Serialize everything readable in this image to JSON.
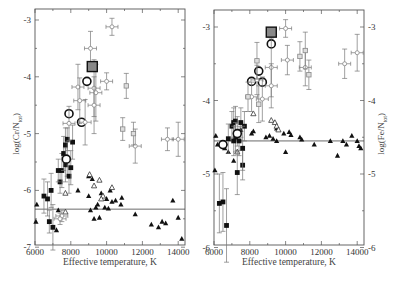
{
  "chart_data": [
    {
      "type": "scatter",
      "title": "",
      "xlabel": "Effective temperature, K",
      "ylabel": "log(Cr/N_tot)",
      "ylabel_main": "log(Cr/N",
      "ylabel_sub": "tot",
      "ylabel_close": ")",
      "xlim": [
        6000,
        14500
      ],
      "ylim": [
        -7,
        -2.8
      ],
      "xticks": [
        6000,
        8000,
        10000,
        12000,
        14000
      ],
      "xtick_labels": [
        "6000",
        "8000",
        "10000",
        "12000",
        "14000"
      ],
      "yticks": [
        -3,
        -4,
        -5,
        -6,
        -7
      ],
      "ytick_labels": [
        "-3",
        "-4",
        "-5",
        "-6",
        "-7"
      ],
      "ytick_side": "left",
      "grid": false,
      "reference_line": -6.33,
      "frame": {
        "x0": 35,
        "x1": 185,
        "y0": 9,
        "y1": 245
      },
      "map": {
        "x_at_6000": 35,
        "px_per_1000K": 17.9,
        "y_at_minus3": 20,
        "px_per_dex": 56.8
      },
      "series": [
        {
          "name": "Normal A stars (filled triangles)",
          "marker": "triangle-filled",
          "points": [
            [
              6100,
              -6.25
            ],
            [
              6050,
              -6.55
            ],
            [
              7200,
              -6.7
            ],
            [
              7300,
              -6.35
            ],
            [
              8400,
              -6.0
            ],
            [
              9000,
              -5.75
            ],
            [
              9000,
              -6.1
            ],
            [
              9200,
              -5.8
            ],
            [
              9100,
              -6.35
            ],
            [
              9300,
              -6.5
            ],
            [
              9400,
              -6.3
            ],
            [
              9500,
              -6.25
            ],
            [
              9600,
              -6.48
            ],
            [
              9700,
              -6.05
            ],
            [
              9800,
              -6.1
            ],
            [
              9900,
              -6.3
            ],
            [
              10000,
              -6.15
            ],
            [
              10100,
              -6.32
            ],
            [
              10200,
              -6.0
            ],
            [
              10300,
              -6.2
            ],
            [
              10500,
              -6.18
            ],
            [
              10800,
              -6.25
            ],
            [
              10850,
              -6.13
            ],
            [
              11600,
              -6.42
            ],
            [
              12500,
              -6.6
            ],
            [
              12900,
              -6.65
            ],
            [
              13100,
              -6.55
            ],
            [
              13300,
              -6.58
            ],
            [
              13700,
              -6.18
            ],
            [
              14000,
              -6.48
            ],
            [
              14200,
              -6.85
            ]
          ]
        },
        {
          "name": "Open triangles",
          "marker": "triangle-open",
          "points": [
            [
              7700,
              -6.05
            ],
            [
              7700,
              -6.38
            ],
            [
              9050,
              -5.72
            ],
            [
              9300,
              -5.92
            ],
            [
              9600,
              -5.82
            ],
            [
              9800,
              -6.1
            ],
            [
              10300,
              -5.95
            ],
            [
              9700,
              -6.15
            ]
          ]
        },
        {
          "name": "Filled squares with error bars",
          "marker": "square-filled",
          "errorbars": true,
          "points": [
            [
              6800,
              -6.55,
              0.2
            ],
            [
              7000,
              -6.65,
              0.4
            ],
            [
              6500,
              -6.1,
              0.3
            ],
            [
              6700,
              -6.15,
              0.3
            ],
            [
              6900,
              -6.0,
              0.3
            ],
            [
              7400,
              -5.85,
              0.2
            ],
            [
              7500,
              -5.65,
              0.3
            ],
            [
              7700,
              -5.55,
              0.3
            ],
            [
              7800,
              -5.45,
              0.3
            ],
            [
              7600,
              -5.35,
              0.3
            ],
            [
              7700,
              -5.2,
              0.3
            ],
            [
              7800,
              -5.1,
              0.2
            ],
            [
              7900,
              -5.75,
              0.3
            ],
            [
              8000,
              -5.6,
              0.3
            ],
            [
              8100,
              -5.15,
              0.3
            ],
            [
              7300,
              -5.65,
              0.2
            ]
          ]
        },
        {
          "name": "Open circles",
          "marker": "circle-open",
          "points": [
            [
              7900,
              -4.65
            ],
            [
              8600,
              -4.8
            ],
            [
              8900,
              -4.08
            ],
            [
              7750,
              -5.45
            ]
          ]
        },
        {
          "name": "Gray diamonds with error bars",
          "marker": "diamond-gray",
          "errorbars": true,
          "points": [
            [
              10300,
              -3.12,
              0.15
            ],
            [
              9100,
              -3.5,
              0.3
            ],
            [
              10000,
              -4.08,
              0.15
            ],
            [
              8400,
              -4.18,
              0.4
            ],
            [
              8500,
              -4.42,
              0.4
            ],
            [
              9300,
              -4.2,
              0.5
            ],
            [
              9400,
              -4.28,
              0.5
            ],
            [
              9300,
              -4.5,
              0.5
            ],
            [
              7900,
              -4.82,
              0.3
            ],
            [
              8800,
              -4.8,
              0.4
            ],
            [
              11600,
              -5.22,
              0.3
            ],
            [
              13400,
              -5.1,
              0.2
            ],
            [
              14000,
              -5.1,
              0.3
            ],
            [
              7500,
              -6.45,
              0.1
            ],
            [
              7400,
              -6.5,
              0.1
            ]
          ]
        },
        {
          "name": "Gray squares with error bars",
          "marker": "square-gray",
          "errorbars": true,
          "points": [
            [
              11100,
              -4.16,
              0.22
            ],
            [
              10900,
              -4.92,
              0.2
            ],
            [
              11500,
              -5.0,
              0.2
            ]
          ]
        },
        {
          "name": "Large framed square (highlighted)",
          "marker": "square-big",
          "points": [
            [
              9200,
              -3.82
            ]
          ]
        }
      ]
    },
    {
      "type": "scatter",
      "title": "",
      "xlabel": "Effective temperature, K",
      "ylabel": "log(Fe/N_tot)",
      "ylabel_main": "log(Fe/N",
      "ylabel_sub": "tot",
      "ylabel_close": ")",
      "xlim": [
        6000,
        14500
      ],
      "ylim": [
        -6,
        -2.8
      ],
      "xticks": [
        6000,
        8000,
        10000,
        12000,
        14000
      ],
      "xtick_labels": [
        "6000",
        "8000",
        "10000",
        "12000",
        "14000"
      ],
      "yticks": [
        -3,
        -4,
        -5,
        -6
      ],
      "ytick_labels": [
        "-3",
        "-4",
        "-5",
        "-6"
      ],
      "ytick_side": "both",
      "grid": false,
      "reference_line": -4.55,
      "frame": {
        "x0": 214,
        "x1": 364,
        "y0": 10,
        "y1": 245
      },
      "map": {
        "x_at_6000": 214,
        "px_per_1000K": 17.9,
        "y_at_minus3": 27,
        "px_per_dex": 73.5
      },
      "series": [
        {
          "name": "Normal A stars (filled triangles)",
          "marker": "triangle-filled",
          "points": [
            [
              6050,
              -4.95
            ],
            [
              6100,
              -4.48
            ],
            [
              6200,
              -4.6
            ],
            [
              6400,
              -4.6
            ],
            [
              6600,
              -4.65
            ],
            [
              6800,
              -4.7
            ],
            [
              7100,
              -4.82
            ],
            [
              7300,
              -4.45
            ],
            [
              7500,
              -4.4
            ],
            [
              8100,
              -4.45
            ],
            [
              8200,
              -4.42
            ],
            [
              8900,
              -4.5
            ],
            [
              9100,
              -4.48
            ],
            [
              9300,
              -4.52
            ],
            [
              9500,
              -4.55
            ],
            [
              9500,
              -4.38
            ],
            [
              9900,
              -4.45
            ],
            [
              10000,
              -4.7
            ],
            [
              10200,
              -4.43
            ],
            [
              10300,
              -4.47
            ],
            [
              10800,
              -4.5
            ],
            [
              10900,
              -4.53
            ],
            [
              11600,
              -4.6
            ],
            [
              12500,
              -4.55
            ],
            [
              12900,
              -4.75
            ],
            [
              13200,
              -4.55
            ],
            [
              13400,
              -4.6
            ],
            [
              13700,
              -4.48
            ],
            [
              14000,
              -4.55
            ],
            [
              14100,
              -4.62
            ],
            [
              14200,
              -4.65
            ]
          ]
        },
        {
          "name": "Open triangles",
          "marker": "triangle-open",
          "points": [
            [
              8200,
              -4.18
            ],
            [
              9200,
              -4.27
            ],
            [
              9400,
              -4.3
            ],
            [
              9500,
              -4.35
            ],
            [
              9600,
              -4.4
            ],
            [
              6600,
              -4.58
            ],
            [
              7300,
              -4.7
            ]
          ]
        },
        {
          "name": "Filled squares with error bars",
          "marker": "square-filled",
          "errorbars": true,
          "points": [
            [
              6300,
              -5.4,
              0.4
            ],
            [
              6500,
              -5.38,
              0.4
            ],
            [
              6700,
              -5.7,
              0.5
            ],
            [
              7300,
              -4.98,
              0.3
            ],
            [
              7600,
              -4.88,
              0.2
            ],
            [
              7000,
              -4.35,
              0.2
            ],
            [
              7100,
              -4.3,
              0.2
            ],
            [
              7200,
              -4.28,
              0.2
            ],
            [
              7300,
              -4.42,
              0.2
            ],
            [
              7500,
              -4.3,
              0.2
            ],
            [
              7700,
              -4.35,
              0.2
            ],
            [
              7200,
              -4.5,
              0.2
            ],
            [
              7400,
              -4.55,
              0.2
            ],
            [
              6800,
              -4.52,
              0.2
            ],
            [
              7100,
              -4.55,
              0.2
            ],
            [
              7600,
              -4.65,
              0.3
            ]
          ]
        },
        {
          "name": "Open circles",
          "marker": "circle-open",
          "points": [
            [
              9200,
              -3.23
            ],
            [
              8500,
              -3.6
            ],
            [
              8100,
              -3.74
            ],
            [
              8700,
              -3.75
            ],
            [
              7300,
              -4.45
            ],
            [
              6500,
              -4.6
            ]
          ]
        },
        {
          "name": "Gray diamonds with error bars",
          "marker": "diamond-gray",
          "errorbars": true,
          "points": [
            [
              10000,
              -3.02,
              0.12
            ],
            [
              10100,
              -3.45,
              0.2
            ],
            [
              9200,
              -3.55,
              0.4
            ],
            [
              11100,
              -3.55,
              0.25
            ],
            [
              13300,
              -3.5,
              0.2
            ],
            [
              14000,
              -3.35,
              0.25
            ],
            [
              9200,
              -3.8,
              0.3
            ],
            [
              8700,
              -3.98,
              0.3
            ],
            [
              8100,
              -3.95,
              0.2
            ],
            [
              8400,
              -3.72,
              0.2
            ]
          ]
        },
        {
          "name": "Gray squares with error bars",
          "marker": "square-gray",
          "errorbars": true,
          "points": [
            [
              10800,
              -3.4,
              0.2
            ],
            [
              11100,
              -3.32,
              0.25
            ],
            [
              11300,
              -3.65,
              0.2
            ],
            [
              8400,
              -3.46,
              0.25
            ],
            [
              8500,
              -4.05,
              0.25
            ],
            [
              7900,
              -3.95,
              0.2
            ]
          ]
        },
        {
          "name": "Large framed square (highlighted)",
          "marker": "square-big",
          "points": [
            [
              9200,
              -3.07
            ]
          ]
        }
      ]
    }
  ],
  "panels": {
    "left": {
      "xlabel": "Effective temperature, K",
      "ylabel_main": "log(Cr/N",
      "ylabel_sub": "tot",
      "ylabel_close": ")"
    },
    "right": {
      "xlabel": "Effective temperature, K",
      "ylabel_main": "log(Fe/N",
      "ylabel_sub": "tot",
      "ylabel_close": ")"
    }
  },
  "colors": {
    "axis": "#555555",
    "marker_black": "#111111",
    "marker_gray": "#888888",
    "errorbar": "#777777",
    "big_square_fill": "#888888"
  }
}
